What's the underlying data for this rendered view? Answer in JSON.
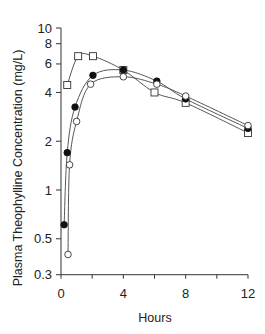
{
  "chart_data": {
    "type": "line",
    "title": "",
    "xlabel": "Hours",
    "ylabel": "Plasma Theophylline Concentration (mg/L)",
    "xlim": [
      0,
      12
    ],
    "ylim": [
      0.3,
      10
    ],
    "yscale": "log",
    "grid": false,
    "legend": null,
    "x_ticks": [
      0,
      2,
      4,
      6,
      8,
      10,
      12
    ],
    "x_tick_labels": [
      "0",
      "4",
      "8",
      "12"
    ],
    "x_tick_label_values": [
      0,
      4,
      8,
      12
    ],
    "y_ticks": [
      0.3,
      0.5,
      1,
      2,
      4,
      6,
      8,
      10
    ],
    "y_tick_labels": [
      "0.3",
      "0.5",
      "1",
      "2",
      "4",
      "6",
      "8",
      "10"
    ],
    "series": [
      {
        "name": "open-square",
        "marker": "square-open",
        "x": [
          0.4,
          1.1,
          2.05,
          4.0,
          6.0,
          8.0,
          12.0
        ],
        "y": [
          4.45,
          6.7,
          6.7,
          5.5,
          4.0,
          3.45,
          2.25
        ]
      },
      {
        "name": "filled-circle",
        "marker": "circle-filled",
        "x": [
          0.2,
          0.4,
          0.9,
          2.05,
          4.0,
          6.15,
          8.0,
          12.0
        ],
        "y": [
          0.61,
          1.7,
          3.25,
          5.1,
          5.5,
          4.7,
          3.65,
          2.4
        ]
      },
      {
        "name": "open-circle",
        "marker": "circle-open",
        "x": [
          0.45,
          0.55,
          1.0,
          1.9,
          4.0,
          6.15,
          8.0,
          12.0
        ],
        "y": [
          0.4,
          1.43,
          2.65,
          4.5,
          5.0,
          4.5,
          3.8,
          2.5
        ]
      }
    ]
  }
}
